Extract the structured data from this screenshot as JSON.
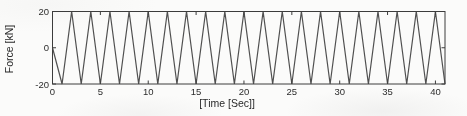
{
  "figure": {
    "background": "#fbfbfa",
    "line_color": "#414141",
    "axis_color": "#3c3c3c",
    "text_color": "#2e2e2e"
  },
  "chart_data": {
    "type": "line",
    "title": "",
    "xlabel": "[Time [Sec]]",
    "ylabel": "Force [kN]",
    "xlim": [
      0,
      41
    ],
    "ylim": [
      -20,
      20
    ],
    "xticks": [
      0,
      5,
      10,
      15,
      20,
      25,
      30,
      35,
      40
    ],
    "yticks": [
      -20,
      0,
      20
    ],
    "grid": false,
    "legend": null,
    "box": true,
    "series": [
      {
        "name": "force",
        "x": [
          0,
          1,
          2,
          3,
          4,
          5,
          6,
          7,
          8,
          9,
          10,
          11,
          12,
          13,
          14,
          15,
          16,
          17,
          18,
          19,
          20,
          21,
          22,
          23,
          24,
          25,
          26,
          27,
          28,
          29,
          30,
          31,
          32,
          33,
          34,
          35,
          36,
          37,
          38,
          39,
          40,
          41
        ],
        "y": [
          0,
          -20,
          20,
          -20,
          20,
          -20,
          20,
          -20,
          20,
          -20,
          20,
          -20,
          20,
          -20,
          20,
          -20,
          20,
          -20,
          20,
          -20,
          20,
          -20,
          20,
          -20,
          20,
          -20,
          20,
          -20,
          20,
          -20,
          20,
          -20,
          20,
          -20,
          20,
          -20,
          20,
          -20,
          20,
          -20,
          20,
          -20
        ]
      }
    ]
  }
}
